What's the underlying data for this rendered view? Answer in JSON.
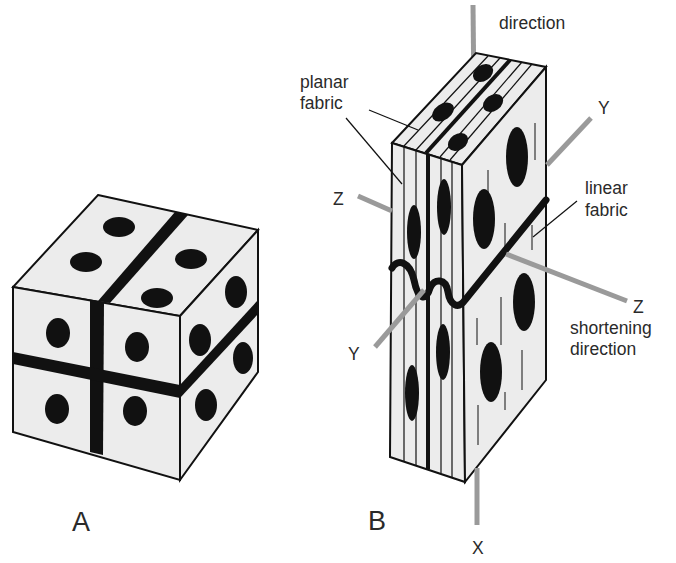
{
  "figure": {
    "panels": [
      {
        "id": "A",
        "label": "A",
        "description": "cube with dots and two perpendicular bands"
      },
      {
        "id": "B",
        "label": "B",
        "description": "strained block showing planar and linear fabric with folded layer"
      }
    ],
    "annotations": {
      "top_direction": "direction",
      "planar_fabric_line1": "planar",
      "planar_fabric_line2": "fabric",
      "linear_fabric_line1": "linear",
      "linear_fabric_line2": "fabric",
      "shortening_line1": "shortening",
      "shortening_line2": "direction"
    },
    "axes": {
      "z_left": "Z",
      "z_right": "Z",
      "y_upper_right": "Y",
      "y_lower_left": "Y",
      "x_bottom": "X"
    },
    "colors": {
      "face_fill": "#ececec",
      "outline": "#111111",
      "axis_line": "#9a9a9a",
      "text": "#2a2a2a"
    }
  }
}
